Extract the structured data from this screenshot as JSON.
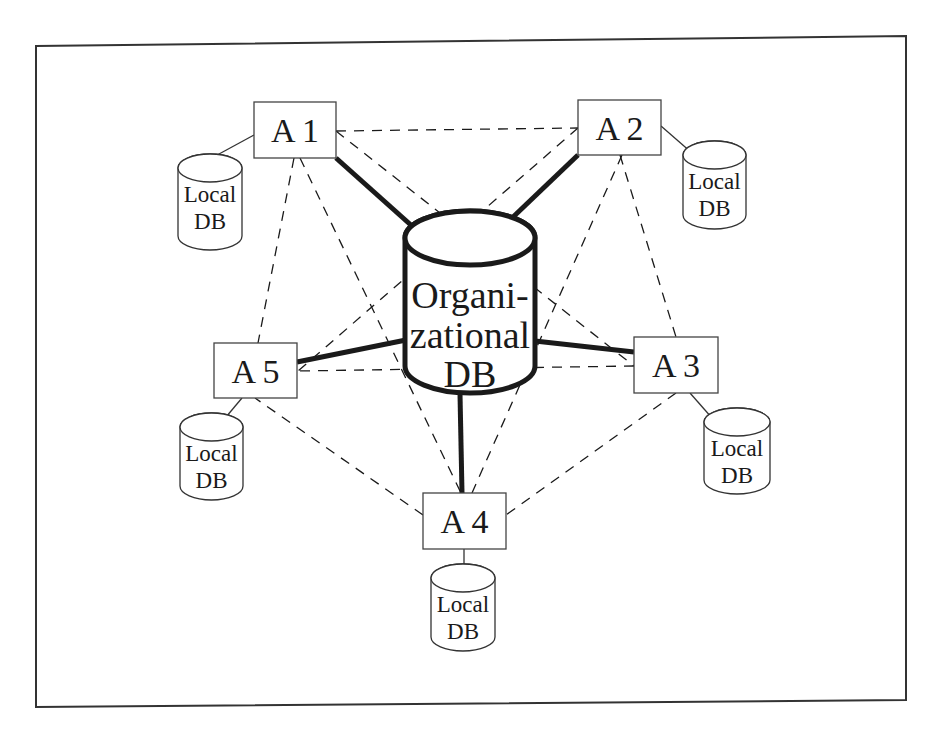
{
  "diagram": {
    "central_db": {
      "id": "org",
      "lines": [
        "Organi-",
        "zational",
        "DB"
      ]
    },
    "agents": [
      {
        "id": "a1",
        "label": "A 1",
        "local_db": [
          "Local",
          "DB"
        ]
      },
      {
        "id": "a2",
        "label": "A 2",
        "local_db": [
          "Local",
          "DB"
        ]
      },
      {
        "id": "a3",
        "label": "A 3",
        "local_db": [
          "Local",
          "DB"
        ]
      },
      {
        "id": "a4",
        "label": "A 4",
        "local_db": [
          "Local",
          "DB"
        ]
      },
      {
        "id": "a5",
        "label": "A 5",
        "local_db": [
          "Local",
          "DB"
        ]
      }
    ],
    "solid_links": [
      {
        "from": "a1",
        "to": "org"
      },
      {
        "from": "a2",
        "to": "org"
      },
      {
        "from": "a3",
        "to": "org"
      },
      {
        "from": "a4",
        "to": "org"
      },
      {
        "from": "a5",
        "to": "org"
      }
    ],
    "dashed_links": [
      {
        "from": "a1",
        "to": "a2"
      },
      {
        "from": "a1",
        "to": "a3"
      },
      {
        "from": "a1",
        "to": "a4"
      },
      {
        "from": "a1",
        "to": "a5"
      },
      {
        "from": "a2",
        "to": "a3"
      },
      {
        "from": "a2",
        "to": "a4"
      },
      {
        "from": "a2",
        "to": "a5"
      },
      {
        "from": "a3",
        "to": "a4"
      },
      {
        "from": "a3",
        "to": "a5"
      },
      {
        "from": "a4",
        "to": "a5"
      }
    ],
    "colors": {
      "stroke": "#1a1a1a",
      "background": "#ffffff"
    }
  }
}
